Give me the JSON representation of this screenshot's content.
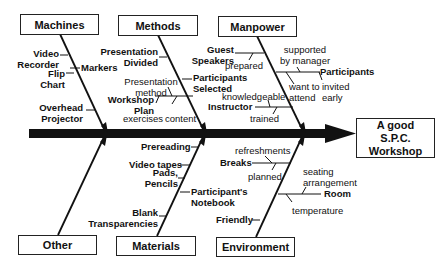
{
  "effect": {
    "line1": "A good",
    "line2": "S.P.C.",
    "line3": "Workshop"
  },
  "categories": {
    "machines": "Machines",
    "methods": "Methods",
    "manpower": "Manpower",
    "other": "Other",
    "materials": "Materials",
    "environment": "Environment"
  },
  "machines": {
    "video_recorder_1": "Video",
    "video_recorder_2": "Recorder",
    "flip_chart_1": "Flip",
    "flip_chart_2": "Chart",
    "markers": "Markers",
    "overhead_1": "Overhead",
    "overhead_2": "Projector"
  },
  "methods": {
    "presentation_divided_1": "Presentation",
    "presentation_divided_2": "Divided",
    "presentation_method_1": "Presentation",
    "presentation_method_2": "method",
    "workshop_plan_1": "Workshop",
    "workshop_plan_2": "Plan",
    "exercises": "exercises",
    "content": "content",
    "participants_selected_1": "Participants",
    "participants_selected_2": "Selected"
  },
  "manpower": {
    "guest_speakers_1": "Guest",
    "guest_speakers_2": "Speakers",
    "prepared": "prepared",
    "supported_1": "supported",
    "supported_2": "by manager",
    "participants": "Participants",
    "want_1": "want to",
    "want_2": "attend",
    "invited_1": "invited",
    "invited_2": "early",
    "knowledgeable": "knowledgeable",
    "instructor": "Instructor",
    "trained": "trained"
  },
  "materials": {
    "prereading": "Prereading",
    "video_tapes": "Video tapes",
    "pads_1": "Pads,",
    "pads_2": "Pencils",
    "notebook_1": "Participant's",
    "notebook_2": "Notebook",
    "blank_1": "Blank",
    "blank_2": "Transparencies"
  },
  "environment": {
    "refreshments": "refreshments",
    "breaks": "Breaks",
    "planned": "planned",
    "seating_1": "seating",
    "seating_2": "arrangement",
    "room": "Room",
    "temperature": "temperature",
    "friendly": "Friendly"
  }
}
